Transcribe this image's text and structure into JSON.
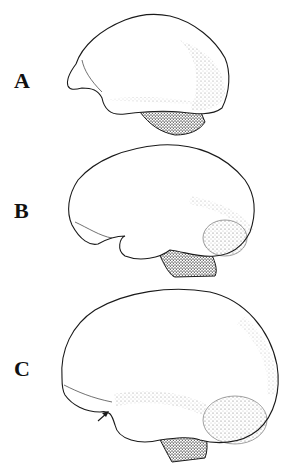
{
  "figure": {
    "panels": [
      {
        "label": "A",
        "subject": "brain lateral view (smallest)"
      },
      {
        "label": "B",
        "subject": "brain lateral view (medium)"
      },
      {
        "label": "C",
        "subject": "brain lateral view (largest) with arrow"
      }
    ],
    "colors": {
      "ink": "#1a1a1a",
      "background": "#ffffff",
      "stipple": "#555555"
    }
  }
}
